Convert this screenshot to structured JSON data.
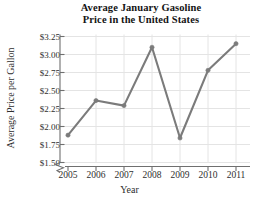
{
  "chart_data": {
    "type": "line",
    "title": "Average January Gasoline Price in the United States",
    "title_lines": [
      "Average January Gasoline",
      "Price in the United States"
    ],
    "xlabel": "Year",
    "ylabel": "Average Price per Gallon",
    "categories": [
      "2005",
      "2006",
      "2007",
      "2008",
      "2009",
      "2010",
      "2011"
    ],
    "x": [
      2005,
      2006,
      2007,
      2008,
      2009,
      2010,
      2011
    ],
    "values": [
      1.88,
      2.36,
      2.29,
      3.1,
      1.84,
      2.78,
      3.15
    ],
    "ylim": [
      1.5,
      3.25
    ],
    "xlim": [
      2005,
      2011
    ],
    "ytick_labels": [
      "$3.25",
      "$3.00",
      "$2.75",
      "$2.50",
      "$2.25",
      "$2.00",
      "$1.75",
      "$1.50"
    ],
    "ytick_values": [
      3.25,
      3.0,
      2.75,
      2.5,
      2.25,
      2.0,
      1.75,
      1.5
    ],
    "xtick_labels": [
      "2005",
      "2006",
      "2007",
      "2008",
      "2009",
      "2010",
      "2011"
    ],
    "grid": true,
    "legend": false,
    "axis_break": true,
    "series_color": "#7b7b7b",
    "grid_color": "#e4e4e4",
    "axis_color": "#6f6f6f",
    "marker": "circle"
  }
}
